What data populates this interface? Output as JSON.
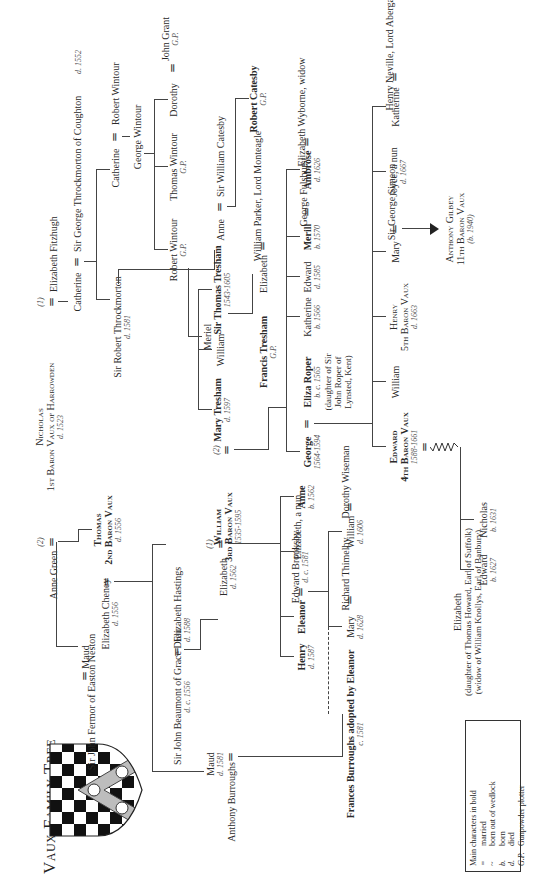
{
  "title": "Vaux Family Tree",
  "legend": {
    "heading": "Main characters in bold",
    "items": [
      {
        "symbol": "=",
        "label": "married"
      },
      {
        "symbol": "~",
        "label": "born out of wedlock"
      },
      {
        "symbol": "b.",
        "label": "born"
      },
      {
        "symbol": "d.",
        "label": "died"
      },
      {
        "symbol": "G.P.",
        "label": "Gunpowder plotter"
      }
    ]
  },
  "people": {
    "anne_green": {
      "name": "Anne Green"
    },
    "nicholas": {
      "name": "Nicholas",
      "title": "1st Baron Vaux of Harrowden",
      "date": "d. 1523"
    },
    "elizabeth_fitzhugh": {
      "name": "Elizabeth Fitzhugh"
    },
    "catherine_vaux": {
      "name": "Catherine"
    },
    "george_throckmorton": {
      "name": "Sir George Throckmorton of Coughton",
      "date": "d. 1552"
    },
    "catherine_throckmorton": {
      "name": "Catherine"
    },
    "robert_wintour_sr": {
      "name": "Robert Wintour"
    },
    "george_wintour": {
      "name": "George Wintour"
    },
    "robert_wintour": {
      "name": "Robert Wintour",
      "date": "G.P."
    },
    "thomas_wintour": {
      "name": "Thomas Wintour",
      "date": "G.P."
    },
    "dorothy_wintour": {
      "name": "Dorothy"
    },
    "john_grant": {
      "name": "John Grant",
      "date": "G.P."
    },
    "robert_throckmorton": {
      "name": "Sir Robert Throckmorton",
      "date": "d. 1581"
    },
    "meriel": {
      "name": "Meriel"
    },
    "anne_throckmorton": {
      "name": "Anne"
    },
    "william_catesby": {
      "name": "Sir William Catesby"
    },
    "robert_catesby": {
      "name": "Robert Catesby",
      "date": "G.P."
    },
    "sir_john_fermor": {
      "name": "Sir John Fermor of Easton Neston"
    },
    "maud_vaux": {
      "name": "Maud"
    },
    "thomas_vaux": {
      "name": "Thomas",
      "title": "2nd Baron Vaux",
      "date": "d. 1556"
    },
    "elizabeth_cheney": {
      "name": "Elizabeth Cheney",
      "date": "d. 1556"
    },
    "maud_burroughs": {
      "name": "Maud",
      "date": "d. 1581"
    },
    "anthony_burroughs": {
      "name": "Anthony Burroughs"
    },
    "john_beaumont": {
      "name": "Sir John Beaumont of Grace Dieu",
      "date": "d. c. 1556"
    },
    "elizabeth_hastings": {
      "name": "Elizabeth Hastings",
      "date": "d. 1588"
    },
    "elizabeth_beaumont": {
      "name": "Elizabeth",
      "date": "d. 1562"
    },
    "william_vaux": {
      "name": "William",
      "title": "3rd Baron Vaux",
      "date": "1535-1595"
    },
    "mary_tresham": {
      "name": "Mary Tresham",
      "date": "d. 1597"
    },
    "william_tresham": {
      "name": "William"
    },
    "thomas_tresham": {
      "name": "Sir Thomas Tresham",
      "date": "1543-1605"
    },
    "francis_tresham": {
      "name": "Francis Tresham",
      "date": "G.P."
    },
    "elizabeth_tresham": {
      "name": "Elizabeth"
    },
    "william_parker": {
      "name": "William Parker, Lord Monteagle"
    },
    "henry_vaux": {
      "name": "Henry",
      "date": "d. 1587"
    },
    "eleanor": {
      "name": "Eleanor"
    },
    "edward_brooksby": {
      "name": "Edward Brooksby",
      "date": "d. c. 1581"
    },
    "elizabeth_nun": {
      "name": "Elizabeth, a nun"
    },
    "anne_vaux": {
      "name": "Anne",
      "date": "b. 1562"
    },
    "frances_burroughs": {
      "name": "Frances Burroughs adopted by Eleanor",
      "date": "c. 1581"
    },
    "mary_brooksby": {
      "name": "Mary",
      "date": "d. 1628"
    },
    "richard_thimelby": {
      "name": "Richard Thimelby"
    },
    "william_brooksby": {
      "name": "William",
      "date": "d. 1606"
    },
    "dorothy_wiseman": {
      "name": "Dorothy Wiseman"
    },
    "george_vaux": {
      "name": "George",
      "date": "1564-1594"
    },
    "eliza_roper": {
      "name": "Eliza Roper",
      "date": "b. c. 1565",
      "note": "(daughter of Sir John Roper of Lynsted, Kent)"
    },
    "katherine_vaux": {
      "name": "Katherine",
      "date": "b. 1566"
    },
    "edward_vaux_1585": {
      "name": "Edward",
      "date": "d. 1585"
    },
    "merill": {
      "name": "Merill",
      "date": "b. 1570"
    },
    "george_fulshurst": {
      "name": "George Fulshurst"
    },
    "ambrose": {
      "name": "Ambrose",
      "date": "d. 1626"
    },
    "elizabeth_wyborne": {
      "name": "Elizabeth Wyborne, widow"
    },
    "edward_4th": {
      "name": "Edward",
      "title": "4th Baron Vaux",
      "date": "1588-1661"
    },
    "william_son": {
      "name": "William"
    },
    "henry_5th": {
      "name": "Henry",
      "title": "5th Baron Vaux",
      "date": "d. 1663"
    },
    "mary_simeon": {
      "name": "Mary"
    },
    "george_simeon": {
      "name": "Sir George Simeon"
    },
    "joyce": {
      "name": "Joyce, a nun",
      "date": "d. 1667"
    },
    "katherine_neville": {
      "name": "Katherine"
    },
    "henry_neville": {
      "name": "Henry Neville, Lord Abergavenny"
    },
    "anthony_gilbey": {
      "name": "Anthony Gilbey",
      "title": "11th Baron Vaux",
      "date": "(b. 1940)"
    },
    "elizabeth_howard": {
      "name": "Elizabeth",
      "note1": "(daughter of Thomas Howard, Earl of Suffolk)",
      "note2": "(widow of William Knollys, Earl of Banbury)"
    },
    "edward_1627": {
      "name": "Edward",
      "date": "b. 1627"
    },
    "nicholas_1631": {
      "name": "Nicholas",
      "date": "b. 1631"
    }
  },
  "marriage_order": {
    "first": "(1)",
    "second": "(2)"
  }
}
